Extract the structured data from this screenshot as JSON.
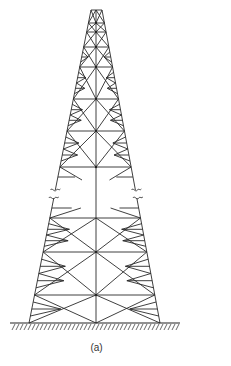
{
  "figure": {
    "caption": "(a)",
    "colors": {
      "line": "#2a2a2a",
      "background": "#ffffff"
    },
    "geometry": {
      "top_y": 10,
      "base_y": 323,
      "top_left_x": 91,
      "top_right_x": 102,
      "base_left_x": 29,
      "base_right_x": 160,
      "center_x": 96,
      "main_levels": [
        10,
        23,
        32,
        47,
        67,
        99,
        131,
        167,
        218,
        252,
        295,
        323
      ],
      "break_between_levels": [
        167,
        218
      ],
      "break_marks_y": [
        190,
        198
      ],
      "ground": {
        "y": 323,
        "x_start": 10,
        "x_end": 180,
        "hatch_spacing": 4,
        "hatch_len": 6
      }
    }
  }
}
